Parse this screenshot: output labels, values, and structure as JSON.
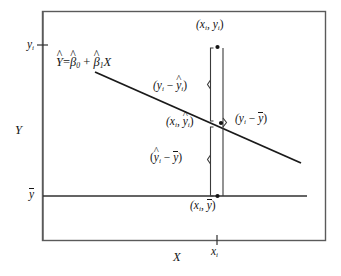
{
  "figure": {
    "colors": {
      "ink": "#141414",
      "frame": "#555555",
      "background": "#ffffff"
    },
    "axes": {
      "x_label": "X",
      "y_label": "Y",
      "x_ticks": [
        {
          "label_base": "x",
          "label_sub": "i"
        }
      ],
      "y_ticks": [
        {
          "label_base": "y",
          "label_sub": "i",
          "overbar": false
        },
        {
          "label_base": "y",
          "label_sub": "",
          "overbar": true
        }
      ]
    },
    "equation": {
      "lhs_hat": "Y",
      "equals": "=",
      "b0_hat": "β",
      "b0_sub": "0",
      "plus": "+",
      "b1_hat": "β",
      "b1_sub": "1",
      "x_var": "X"
    },
    "points": [
      {
        "name": "observed-point",
        "label_text": "(x",
        "label_sub": "i",
        "label_mid": ", y",
        "label_sub2": "i",
        "label_end": ")"
      },
      {
        "name": "fitted-point",
        "label_text": "(x",
        "label_sub": "i",
        "label_mid": ", y",
        "label_sub2": "i",
        "label_end": ")"
      },
      {
        "name": "mean-point",
        "label_text": "(x",
        "label_sub": "i",
        "label_mid": ", y",
        "label_end": ")"
      }
    ],
    "annotations": {
      "residual": {
        "open": "(y",
        "sub1": "i",
        "minus": " − ",
        "hat_base": "y",
        "sub2": "i",
        "close": ")"
      },
      "regression": {
        "open": "(",
        "hat_base": "y",
        "sub1": "i",
        "minus": " − ",
        "bar_base": "y",
        "close": ")"
      },
      "total": {
        "open": "(y",
        "sub1": "i",
        "minus": " − ",
        "bar_base": "y",
        "close": ")"
      }
    },
    "mean_line_label": "mean-of-y-line",
    "regression_line_label": "fitted-regression-line"
  }
}
